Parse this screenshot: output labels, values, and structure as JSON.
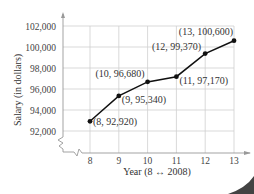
{
  "chart_data": {
    "type": "line",
    "title": "",
    "xlabel": "Year (8 ↔ 2008)",
    "ylabel": "Salary (in dollars)",
    "x": [
      8,
      9,
      10,
      11,
      12,
      13
    ],
    "series": [
      {
        "name": "Salary",
        "values": [
          92920,
          95340,
          96680,
          97170,
          99370,
          100600
        ]
      }
    ],
    "point_labels": [
      "(8, 92,920)",
      "(9, 95,340)",
      "(10, 96,680)",
      "(11, 97,170)",
      "(12, 99,370)",
      "(13, 100,600)"
    ],
    "xticks": [
      "8",
      "9",
      "10",
      "11",
      "12",
      "13"
    ],
    "yticks": [
      "92,000",
      "94,000",
      "96,000",
      "98,000",
      "100,000",
      "102,000"
    ],
    "ylim": [
      92000,
      102000
    ],
    "xlim": [
      8,
      13
    ],
    "grid": true,
    "y_axis_break": true,
    "legend": null
  },
  "colors": {
    "line": "#111111",
    "grid": "#cfcfcf",
    "axis": "#999999",
    "text": "#333333"
  }
}
